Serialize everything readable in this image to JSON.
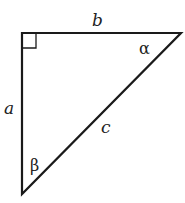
{
  "diagram": {
    "type": "right-triangle",
    "line_color": "#1a1a1a",
    "labels": {
      "side_top": "b",
      "side_left": "a",
      "hypotenuse": "c",
      "angle_top_right": "α",
      "angle_bottom": "β"
    }
  }
}
